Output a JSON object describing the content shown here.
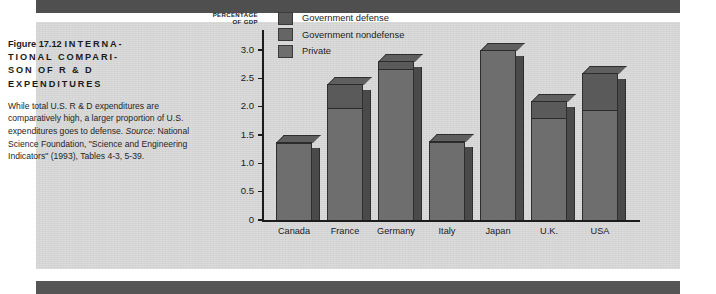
{
  "page": {
    "band_color": "#4f4f4f",
    "panel_color": "#d8d8d8"
  },
  "caption": {
    "figure_number": "Figure 17.12",
    "title": "INTERNATIONAL COMPARISON OF R & D EXPENDITURES",
    "title_line1": "INTERNA-",
    "title_line2": "TIONAL COMPARI-",
    "title_line3": "SON OF R & D",
    "title_line4": "EXPENDITURES",
    "body": "While total U.S. R & D expenditures are comparatively high, a larger proportion of U.S. expenditures goes to defense. ",
    "source": "Source: ",
    "source_text": "National Science Foundation, \"Science and Engineering Indicators\" (1993), Tables 4-3, 5-39."
  },
  "chart_data": {
    "type": "bar",
    "subtype": "stacked-3d-column",
    "xlabel": "",
    "ylabel": "PERCENTAGE OF GDP",
    "ylabel_line1": "PERCENTAGE",
    "ylabel_line2": "OF GDP",
    "ylim": [
      0,
      3.0
    ],
    "yticks": [
      0,
      0.5,
      1.0,
      1.5,
      2.0,
      2.5,
      3.0
    ],
    "ytick_labels": [
      "0",
      "0.5",
      "1.0",
      "1.5",
      "2.0",
      "2.5",
      "3.0"
    ],
    "grid": false,
    "legend_position": "top-left-inside",
    "categories": [
      "Canada",
      "France",
      "Germany",
      "Italy",
      "Japan",
      "U.K.",
      "USA"
    ],
    "series": [
      {
        "name": "Private",
        "color": "#6e6e6e",
        "values": [
          0.78,
          1.25,
          1.78,
          0.68,
          2.47,
          1.41,
          1.48
        ]
      },
      {
        "name": "Government nondefense",
        "color": "#6e6e6e",
        "values": [
          0.58,
          0.73,
          0.89,
          0.7,
          0.53,
          0.39,
          0.47
        ]
      },
      {
        "name": "Government defense",
        "color": "#5a5a5a",
        "values": [
          0.02,
          0.42,
          0.13,
          0.02,
          0.0,
          0.3,
          0.65
        ]
      }
    ],
    "totals": [
      1.38,
      2.4,
      2.8,
      1.4,
      3.0,
      2.1,
      2.6
    ],
    "legend": [
      {
        "label": "Government defense",
        "color": "#5a5a5a"
      },
      {
        "label": "Government nondefense",
        "color": "#656565"
      },
      {
        "label": "Private",
        "color": "#6e6e6e"
      }
    ],
    "units": "percent of GDP"
  }
}
